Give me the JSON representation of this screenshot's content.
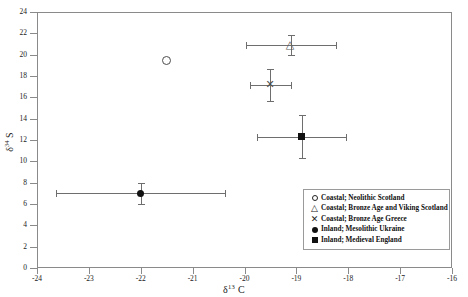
{
  "chart_data": {
    "type": "scatter",
    "title": "",
    "xlabel": "δ¹³ C",
    "ylabel": "δ³⁴ S",
    "xlim": [
      -24,
      -16
    ],
    "ylim": [
      0,
      24
    ],
    "xticks": [
      -24,
      -23,
      -22,
      -21,
      -20,
      -19,
      -18,
      -17,
      -16
    ],
    "yticks": [
      0,
      2,
      4,
      6,
      8,
      10,
      12,
      14,
      16,
      18,
      20,
      22,
      24
    ],
    "grid": false,
    "legend_position": "bottom-right",
    "series": [
      {
        "name": "Coastal; Neolithic Scotland",
        "marker": "open-circle",
        "points": [
          {
            "x": -21.5,
            "y": 19.5,
            "xerr": 0,
            "yerr": 0
          }
        ]
      },
      {
        "name": "Coastal; Bronze Age and Viking Scotland",
        "marker": "open-triangle",
        "points": [
          {
            "x": -19.1,
            "y": 20.9,
            "xerr": 0.87,
            "yerr": 0.95
          }
        ]
      },
      {
        "name": "Coastal; Bronze Age Greece",
        "marker": "cross",
        "points": [
          {
            "x": -19.5,
            "y": 17.2,
            "xerr": 0.4,
            "yerr": 1.5
          }
        ]
      },
      {
        "name": "Inland; Mesolithic Ukraine",
        "marker": "filled-circle",
        "points": [
          {
            "x": -22.0,
            "y": 7.0,
            "xerr": 1.63,
            "yerr": 1.0
          }
        ]
      },
      {
        "name": "Inland; Medieval England",
        "marker": "filled-square",
        "points": [
          {
            "x": -18.9,
            "y": 12.3,
            "xerr": 0.86,
            "yerr": 2.0
          }
        ]
      }
    ],
    "legend": [
      {
        "symbol": "open-circle",
        "label": "Coastal; Neolithic Scotland"
      },
      {
        "symbol": "open-triangle",
        "label": "Coastal; Bronze Age and Viking Scotland"
      },
      {
        "symbol": "cross",
        "label": "Coastal; Bronze Age Greece"
      },
      {
        "symbol": "filled-circle",
        "label": "Inland; Mesolithic Ukraine"
      },
      {
        "symbol": "filled-square",
        "label": "Inland; Medieval England"
      }
    ]
  },
  "axes": {
    "x_tick_labels": [
      "-24",
      "-23",
      "-22",
      "-21",
      "-20",
      "-19",
      "-18",
      "-17",
      "-16"
    ],
    "y_tick_labels": [
      "0",
      "2",
      "4",
      "6",
      "8",
      "10",
      "12",
      "14",
      "16",
      "18",
      "20",
      "22",
      "24"
    ],
    "x_title_base": "δ",
    "x_title_sup": "13",
    "x_title_tail": " C",
    "y_title_base": "δ",
    "y_title_sup": "34",
    "y_title_tail": " S"
  },
  "symbols": {
    "open_triangle_glyph": "△",
    "cross_glyph": "✕"
  }
}
